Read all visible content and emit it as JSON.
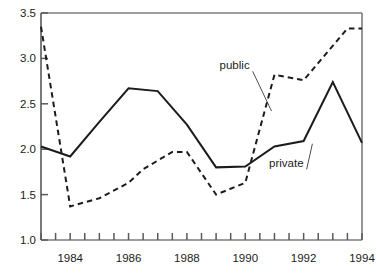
{
  "chart_data": {
    "type": "line",
    "title": "",
    "subtitle": "",
    "xlabel": "",
    "ylabel": "",
    "x": [
      1983,
      1984,
      1985,
      1986,
      1987,
      1988,
      1989,
      1990,
      1991,
      1992,
      1993,
      1994
    ],
    "xlim": [
      1983,
      1994
    ],
    "ylim": [
      1.0,
      3.5
    ],
    "xticks": [
      1983,
      1983.5,
      1984,
      1984.5,
      1985,
      1985.5,
      1986,
      1986.5,
      1987,
      1987.5,
      1988,
      1988.5,
      1989,
      1989.5,
      1990,
      1990.5,
      1991,
      1991.5,
      1992,
      1992.5,
      1993,
      1993.5,
      1994
    ],
    "xtick_labels": [
      "1984",
      "1986",
      "1988",
      "1990",
      "1992",
      "1994"
    ],
    "xtick_label_values": [
      1984,
      1986,
      1988,
      1990,
      1992,
      1994
    ],
    "yticks": [
      1.0,
      1.5,
      2.0,
      2.5,
      3.0,
      3.5
    ],
    "ytick_labels": [
      "1.0",
      "1.5",
      "2.0",
      "2.5",
      "3.0",
      "3.5"
    ],
    "grid": false,
    "legend_position": "inline-annotations",
    "series": [
      {
        "name": "public",
        "style": "dashed",
        "color": "#1c1c1c",
        "values": [
          3.35,
          1.37,
          1.46,
          1.63,
          1.78,
          1.97,
          1.97,
          1.5,
          1.63,
          2.82,
          2.76,
          3.33,
          3.33
        ],
        "x": [
          1983,
          1984,
          1985,
          1986,
          1986.5,
          1987.5,
          1988,
          1989,
          1990,
          1991,
          1992,
          1993.5,
          1994
        ],
        "label": "public",
        "label_x": 1990.15,
        "label_y": 2.88,
        "leader_to_x": 1990.9,
        "leader_to_y": 2.42
      },
      {
        "name": "private",
        "style": "solid",
        "color": "#1c1c1c",
        "values": [
          2.03,
          1.92,
          2.3,
          2.67,
          2.64,
          2.27,
          1.8,
          1.81,
          2.03,
          2.09,
          2.74,
          2.07
        ],
        "x": [
          1983,
          1984,
          1985,
          1986,
          1987,
          1988,
          1989,
          1990,
          1991,
          1992,
          1993,
          1994
        ],
        "label": "private",
        "label_x": 1992.0,
        "label_y": 1.8,
        "leader_to_x": 1992.3,
        "leader_to_y": 2.06
      }
    ],
    "annotations": [
      {
        "text": "public",
        "series": "public"
      },
      {
        "text": "private",
        "series": "private"
      }
    ],
    "axis_color": "#5a5a5a",
    "line_color": "#1c1c1c"
  },
  "axis": {
    "y_labels": [
      "3.5",
      "3.0",
      "2.5",
      "2.0",
      "1.5",
      "1.0"
    ],
    "x_labels": [
      "1984",
      "1986",
      "1988",
      "1990",
      "1992",
      "1994"
    ]
  },
  "labels": {
    "public": "public",
    "private": "private"
  }
}
